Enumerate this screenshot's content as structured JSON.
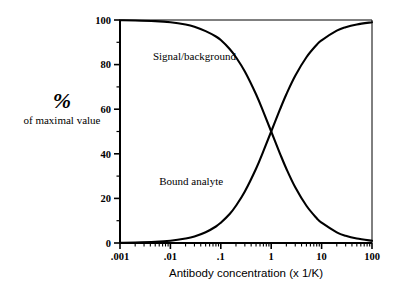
{
  "chart_data": {
    "type": "line",
    "title": "",
    "xlabel": "Antibody concentration (x 1/K)",
    "ylabel_main": "%",
    "ylabel_sub": "of maximal value",
    "xscale": "log",
    "yscale": "linear",
    "xlim": [
      0.001,
      100
    ],
    "ylim": [
      0,
      100
    ],
    "grid": false,
    "legend_position": "inline-annotations",
    "x_tick_labels": [
      ".001",
      ".01",
      ".1",
      "1",
      "10",
      "100"
    ],
    "x_tick_values": [
      0.001,
      0.01,
      0.1,
      1,
      10,
      100
    ],
    "y_tick_labels": [
      "0",
      "20",
      "40",
      "60",
      "80",
      "100"
    ],
    "y_tick_values": [
      0,
      20,
      40,
      60,
      80,
      100
    ],
    "y_minor_ticks": [
      10,
      30,
      50,
      70,
      90
    ],
    "x_minor_ticks_per_decade": [
      2,
      3,
      4,
      5,
      6,
      7,
      8,
      9
    ],
    "series": [
      {
        "name": "Signal/background",
        "color": "#000000",
        "x": [
          0.001,
          0.002,
          0.005,
          0.01,
          0.02,
          0.03,
          0.05,
          0.08,
          0.1,
          0.15,
          0.2,
          0.3,
          0.5,
          0.7,
          1,
          1.5,
          2,
          3,
          5,
          8,
          10,
          20,
          30,
          50,
          100
        ],
        "values": [
          99.9,
          99.8,
          99.5,
          99,
          98,
          97,
          95,
          92.6,
          91,
          87,
          83.3,
          76.9,
          66.7,
          58.8,
          50,
          40,
          33.3,
          25,
          16.7,
          11.1,
          9.1,
          4.8,
          3.2,
          2.0,
          1.0
        ]
      },
      {
        "name": "Bound analyte",
        "color": "#000000",
        "x": [
          0.001,
          0.002,
          0.005,
          0.01,
          0.02,
          0.03,
          0.05,
          0.08,
          0.1,
          0.15,
          0.2,
          0.3,
          0.5,
          0.7,
          1,
          1.5,
          2,
          3,
          5,
          8,
          10,
          20,
          30,
          50,
          100
        ],
        "values": [
          0.1,
          0.2,
          0.5,
          1.0,
          2.0,
          2.9,
          4.8,
          7.4,
          9.1,
          13.0,
          16.7,
          23.1,
          33.3,
          41.2,
          50,
          60,
          66.7,
          75,
          83.3,
          88.9,
          90.9,
          95.2,
          96.8,
          98.0,
          99.0
        ]
      }
    ],
    "annotations": [
      {
        "text": "Signal/background",
        "x_data": 0.0045,
        "y_data": 82
      },
      {
        "text": "Bound analyte",
        "x_data": 0.006,
        "y_data": 26
      }
    ],
    "crossing_point": {
      "x": 1,
      "y": 50
    }
  }
}
